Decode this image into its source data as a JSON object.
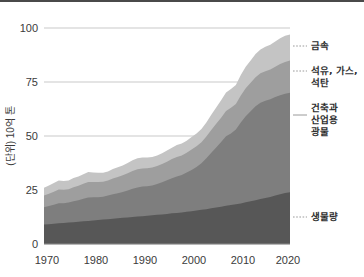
{
  "chart_data": {
    "type": "area",
    "stacked": true,
    "title": "",
    "subtitle": "",
    "xlabel": "",
    "ylabel": "(단위) 10억 톤",
    "x": [
      1970,
      1971,
      1972,
      1973,
      1974,
      1975,
      1976,
      1977,
      1978,
      1979,
      1980,
      1981,
      1982,
      1983,
      1984,
      1985,
      1986,
      1987,
      1988,
      1989,
      1990,
      1991,
      1992,
      1993,
      1994,
      1995,
      1996,
      1997,
      1998,
      1999,
      2000,
      2001,
      2002,
      2003,
      2004,
      2005,
      2006,
      2007,
      2008,
      2009,
      2010,
      2011,
      2012,
      2013,
      2014,
      2015,
      2016,
      2017,
      2018,
      2019,
      2020
    ],
    "xlim": [
      1970,
      2020
    ],
    "ylim": [
      0,
      100
    ],
    "xticks": [
      1970,
      1980,
      1990,
      2000,
      2010,
      2020
    ],
    "xtick_labels": [
      "1970",
      "1980",
      "1990",
      "2000",
      "2010",
      "2020"
    ],
    "yticks": [
      0,
      25,
      50,
      75,
      100
    ],
    "ytick_labels": [
      "0",
      "25",
      "50",
      "75",
      "100"
    ],
    "grid": "horizontal",
    "legend_position": "right-outside",
    "series": [
      {
        "name": "생물량",
        "color": "#575757",
        "order": 1,
        "values": [
          9.0,
          9.2,
          9.4,
          9.6,
          9.7,
          9.9,
          10.1,
          10.3,
          10.5,
          10.7,
          10.9,
          11.1,
          11.3,
          11.5,
          11.7,
          11.9,
          12.1,
          12.3,
          12.5,
          12.7,
          12.9,
          13.1,
          13.3,
          13.5,
          13.7,
          13.9,
          14.2,
          14.4,
          14.6,
          14.9,
          15.2,
          15.5,
          15.8,
          16.1,
          16.5,
          16.9,
          17.3,
          17.7,
          18.1,
          18.4,
          18.8,
          19.3,
          19.8,
          20.3,
          20.8,
          21.3,
          21.8,
          22.4,
          23.0,
          23.6,
          24.0
        ]
      },
      {
        "name": "건축과 산업용 광물",
        "color": "#7e7e7e",
        "order": 2,
        "values": [
          8.0,
          8.4,
          8.8,
          9.3,
          9.2,
          9.3,
          9.7,
          10.0,
          10.5,
          10.8,
          10.7,
          10.6,
          10.6,
          10.9,
          11.3,
          11.6,
          12.0,
          12.5,
          13.1,
          13.5,
          13.7,
          13.6,
          13.8,
          14.3,
          14.9,
          15.6,
          16.2,
          16.9,
          17.4,
          18.2,
          19.1,
          20.2,
          21.6,
          23.6,
          25.7,
          27.8,
          29.9,
          32.2,
          33.1,
          34.6,
          37.5,
          39.9,
          41.7,
          43.5,
          44.6,
          45.0,
          45.2,
          45.6,
          45.9,
          46.0,
          46.0
        ]
      },
      {
        "name": "석유, 가스, 석탄",
        "color": "#9e9e9e",
        "order": 3,
        "values": [
          5.4,
          5.7,
          6.0,
          6.3,
          6.2,
          6.2,
          6.5,
          6.7,
          6.9,
          7.2,
          7.1,
          7.0,
          6.9,
          7.0,
          7.3,
          7.5,
          7.7,
          7.9,
          8.2,
          8.4,
          8.4,
          8.4,
          8.3,
          8.3,
          8.4,
          8.6,
          8.9,
          9.0,
          9.0,
          9.1,
          9.4,
          9.5,
          9.7,
          10.1,
          10.6,
          11.0,
          11.3,
          11.7,
          11.9,
          11.8,
          12.4,
          12.9,
          13.1,
          13.4,
          13.6,
          13.7,
          13.8,
          14.1,
          14.4,
          14.7,
          14.9
        ]
      },
      {
        "name": "금속",
        "color": "#c4c4c4",
        "order": 4,
        "values": [
          3.6,
          3.8,
          4.0,
          4.2,
          4.1,
          4.0,
          4.2,
          4.3,
          4.4,
          4.6,
          4.4,
          4.3,
          4.2,
          4.2,
          4.4,
          4.5,
          4.6,
          4.8,
          5.0,
          5.1,
          5.1,
          5.0,
          4.9,
          4.9,
          5.0,
          5.2,
          5.3,
          5.5,
          5.5,
          5.6,
          5.8,
          5.9,
          6.1,
          6.5,
          7.0,
          7.5,
          8.0,
          8.5,
          8.7,
          8.8,
          9.5,
          10.0,
          10.4,
          10.8,
          11.1,
          11.3,
          11.5,
          11.7,
          11.9,
          12.1,
          12.1
        ]
      }
    ],
    "totals_note": "total rises from about 26 in 1970 to about 97 in 2020"
  },
  "axis": {
    "y_title": "(단위) 10억 톤",
    "y_tick_100": "100",
    "y_tick_75": "75",
    "y_tick_50": "50",
    "y_tick_25": "25",
    "y_tick_0": "0",
    "x_tick_1970": "1970",
    "x_tick_1980": "1980",
    "x_tick_1990": "1990",
    "x_tick_2000": "2000",
    "x_tick_2010": "2010",
    "x_tick_2020": "2020"
  },
  "legend": {
    "metals": "금속",
    "fossil_line1": "석유, 가스,",
    "fossil_line2": "석탄",
    "minerals_line1": "건축과",
    "minerals_line2": "산업용",
    "minerals_line3": "광물",
    "biomass": "생물량"
  }
}
